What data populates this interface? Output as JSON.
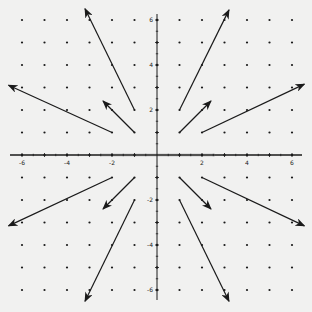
{
  "figure": {
    "type": "vector_field",
    "background": "#f1f1f0",
    "ink": "#1a1a1a",
    "origin_px": [
      157,
      155
    ],
    "unit_px": 22.5,
    "xrange": [
      -6,
      6
    ],
    "yrange": [
      -6,
      6
    ],
    "x_axis": {
      "ticks": [
        -6,
        -4,
        -2,
        2,
        4,
        6
      ],
      "tick_labels": [
        "-6",
        "-4",
        "-2",
        "2",
        "4",
        "6"
      ]
    },
    "y_axis": {
      "ticks": [
        6,
        4,
        2,
        -2,
        -4,
        -6
      ],
      "tick_labels": [
        "6",
        "4",
        "2",
        "-2",
        "-4",
        "-6"
      ]
    },
    "grid_dots": "integer lattice points from -6 to 6",
    "arrows": [
      {
        "from": [
          1,
          1
        ],
        "vector": [
          1.4,
          1.4
        ]
      },
      {
        "from": [
          1,
          2
        ],
        "vector": [
          2.2,
          4.45
        ]
      },
      {
        "from": [
          2,
          1
        ],
        "vector": [
          4.55,
          2.15
        ]
      },
      {
        "from": [
          -1,
          1
        ],
        "vector": [
          -1.4,
          1.4
        ]
      },
      {
        "from": [
          -1,
          2
        ],
        "vector": [
          -2.2,
          4.5
        ]
      },
      {
        "from": [
          -2,
          1
        ],
        "vector": [
          -4.6,
          2.1
        ]
      },
      {
        "from": [
          -1,
          -1
        ],
        "vector": [
          -1.4,
          -1.4
        ]
      },
      {
        "from": [
          -1,
          -2
        ],
        "vector": [
          -2.2,
          -4.5
        ]
      },
      {
        "from": [
          -2,
          -1
        ],
        "vector": [
          -4.6,
          -2.15
        ]
      },
      {
        "from": [
          1,
          -1
        ],
        "vector": [
          1.4,
          -1.4
        ]
      },
      {
        "from": [
          1,
          -2
        ],
        "vector": [
          2.2,
          -4.5
        ]
      },
      {
        "from": [
          2,
          -1
        ],
        "vector": [
          4.55,
          -2.15
        ]
      }
    ]
  }
}
